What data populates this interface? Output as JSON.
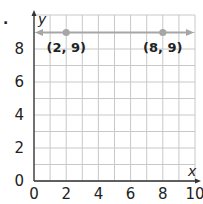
{
  "chart_data": {
    "type": "line",
    "title": "",
    "xlabel": "x",
    "ylabel": "y",
    "xlim": [
      0,
      10
    ],
    "ylim": [
      0,
      9.5
    ],
    "grid": true,
    "x_ticks": [
      "0",
      "2",
      "4",
      "6",
      "8",
      "10"
    ],
    "y_ticks": [
      "0",
      "2",
      "4",
      "6",
      "8"
    ],
    "series": [
      {
        "name": "horizontal line y = 9",
        "x": [
          2,
          8
        ],
        "y": [
          9,
          9
        ],
        "arrows_both_ends": true,
        "color": "#a6a6a6"
      }
    ],
    "annotations": [
      {
        "text": "(2, 9)",
        "x": 2,
        "y": 9
      },
      {
        "text": "(8, 9)",
        "x": 8,
        "y": 9
      }
    ]
  },
  "bullet": "."
}
